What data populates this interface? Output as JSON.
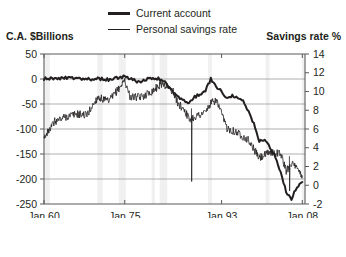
{
  "legend": {
    "items": [
      {
        "label": "Current account",
        "style": "thick"
      },
      {
        "label": "Personal savings rate",
        "style": "thin"
      }
    ]
  },
  "axis_titles": {
    "left": "C.A. $Billions",
    "right": "Savings rate %"
  },
  "chart_data": {
    "type": "line",
    "title": "",
    "xlabel": "",
    "ylabel": "C.A. $Billions",
    "y2label": "Savings rate %",
    "grid": true,
    "legend_position": "top-center",
    "xlim": [
      1960,
      2008.5
    ],
    "xticks": [
      1960,
      1975,
      1993,
      2008
    ],
    "xticklabels": [
      "Jan 60",
      "Jan 75",
      "Jan 93",
      "Jan 08"
    ],
    "ylim": [
      -250,
      50
    ],
    "yticks": [
      50,
      0,
      -50,
      -100,
      -150,
      -200,
      -250
    ],
    "yticklabels": [
      "50",
      "0",
      "-50",
      "-100",
      "-150",
      "-200",
      "-250"
    ],
    "y2lim": [
      -2,
      14
    ],
    "y2ticks": [
      14,
      12,
      10,
      8,
      6,
      4,
      2,
      0,
      -2
    ],
    "y2ticklabels": [
      "14",
      "12",
      "10",
      "8",
      "6",
      "4",
      "2",
      "0",
      "-2"
    ],
    "recession_bands": [
      [
        1960.2,
        1961.1
      ],
      [
        1969.9,
        1970.9
      ],
      [
        1973.9,
        1975.2
      ],
      [
        1980.0,
        1980.6
      ],
      [
        1981.5,
        1982.9
      ],
      [
        1990.5,
        1991.2
      ],
      [
        2001.2,
        2001.9
      ],
      [
        2007.9,
        2008.4
      ]
    ],
    "series": [
      {
        "name": "Current account",
        "axis": "left",
        "style": "thick",
        "color": "#231f20",
        "x": [
          1960,
          1961,
          1962,
          1963,
          1964,
          1965,
          1966,
          1967,
          1968,
          1969,
          1970,
          1971,
          1972,
          1973,
          1974,
          1975,
          1976,
          1977,
          1978,
          1979,
          1980,
          1981,
          1982,
          1983,
          1984,
          1985,
          1986,
          1987,
          1988,
          1989,
          1990,
          1991,
          1992,
          1993,
          1994,
          1995,
          1996,
          1997,
          1998,
          1999,
          2000,
          2001,
          2002,
          2003,
          2004,
          2005,
          2006,
          2007,
          2008
        ],
        "values": [
          2.8,
          3.8,
          3.4,
          4.4,
          6.8,
          5.4,
          3.0,
          2.6,
          0.6,
          0.4,
          2.3,
          -1.4,
          -5.8,
          7.1,
          2.0,
          18.1,
          4.3,
          -14.3,
          -15.1,
          -0.3,
          2.3,
          5.0,
          -5.5,
          -38.7,
          -94.3,
          -118.2,
          -147.2,
          -160.7,
          -121.2,
          -99.5,
          -79.0,
          2.9,
          -51.6,
          -84.8,
          -121.6,
          -113.6,
          -124.8,
          -140.7,
          -215.1,
          -301.6,
          -417.4,
          -398.3,
          -459.1,
          -521.4,
          -631.1,
          -748.7,
          -803.5,
          -718.1,
          -686.6
        ],
        "values_scaled_note": "values plotted on left axis in $Billions, rendered path approximates monthly data"
      },
      {
        "name": "Personal savings rate",
        "axis": "right",
        "style": "thin",
        "color": "#231f20",
        "x": [
          1960,
          1962,
          1964,
          1966,
          1968,
          1970,
          1972,
          1974,
          1975,
          1976,
          1978,
          1980,
          1982,
          1984,
          1985,
          1986,
          1987,
          1988,
          1990,
          1991,
          1992,
          1994,
          1996,
          1998,
          2000,
          2002,
          2004,
          2005,
          2006,
          2007,
          2008
        ],
        "values": [
          5.0,
          6.8,
          7.3,
          7.6,
          7.5,
          9.4,
          8.9,
          10.4,
          11.2,
          9.4,
          9.4,
          10.0,
          10.9,
          10.0,
          8.6,
          8.2,
          7.0,
          7.3,
          7.8,
          8.7,
          9.1,
          6.1,
          5.6,
          4.8,
          2.9,
          3.5,
          3.4,
          1.5,
          2.4,
          1.7,
          1.0
        ],
        "values_scaled_note": "values plotted on right axis in percent, rendered path approximates monthly data"
      }
    ]
  }
}
